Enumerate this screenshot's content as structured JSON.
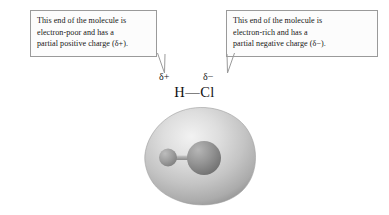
{
  "figure": {
    "background_color": "#ffffff"
  },
  "callouts": [
    {
      "id": "left",
      "name": "callout-electron-poor",
      "lines": [
        "This end of the molecule is",
        "electron-poor and has a",
        "partial positive charge (δ+)."
      ],
      "border_color": "#9a9a9a",
      "fill_color": "#fcfcfc",
      "points_to": "delta-plus"
    },
    {
      "id": "right",
      "name": "callout-electron-rich",
      "lines": [
        "This end of the molecule is",
        "electron-rich and has a",
        "partial negative charge (δ−)."
      ],
      "border_color": "#9a9a9a",
      "fill_color": "#fcfcfc",
      "points_to": "delta-minus"
    }
  ],
  "formula": {
    "text": "H—Cl",
    "hydrogen_label": "H",
    "chlorine_label": "Cl",
    "bond_glyph": "—",
    "delta_positive": "δ+",
    "delta_negative": "δ−"
  },
  "molecule_model": {
    "type": "electrostatic-potential-surface",
    "surface_color_light": "#e6e6e6",
    "surface_color_mid": "#c6c6c6",
    "surface_color_dark": "#8e8e8e",
    "atoms": [
      {
        "label": "H",
        "name": "hydrogen-atom-sphere",
        "color": "#9a9a9a",
        "radius_px": 9
      },
      {
        "label": "Cl",
        "name": "chlorine-atom-sphere",
        "color": "#8f8f8f",
        "radius_px": 17
      }
    ],
    "bond": {
      "name": "h-cl-bond",
      "color": "#a8a8a8"
    }
  }
}
